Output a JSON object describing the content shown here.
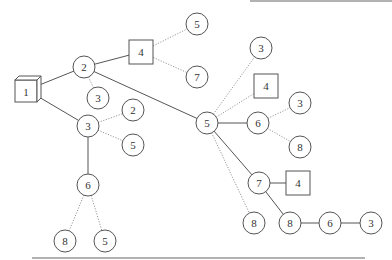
{
  "diagram": {
    "type": "tree",
    "top_rule": {
      "x1": 250,
      "x2": 392,
      "y": 1
    },
    "bottom_rule": {
      "x1": 32,
      "x2": 365,
      "y": 258
    },
    "nodes": [
      {
        "id": "n1",
        "label": "1",
        "shape": "cube",
        "x": 27,
        "y": 90
      },
      {
        "id": "n2",
        "label": "2",
        "shape": "circle",
        "x": 84,
        "y": 67
      },
      {
        "id": "n3a",
        "label": "3",
        "shape": "circle",
        "x": 98,
        "y": 98
      },
      {
        "id": "n3b",
        "label": "3",
        "shape": "circle",
        "x": 88,
        "y": 126
      },
      {
        "id": "n2b",
        "label": "2",
        "shape": "circle",
        "x": 133,
        "y": 110
      },
      {
        "id": "n5a",
        "label": "5",
        "shape": "circle",
        "x": 133,
        "y": 145
      },
      {
        "id": "n4a",
        "label": "4",
        "shape": "square",
        "x": 141,
        "y": 52
      },
      {
        "id": "n5b",
        "label": "5",
        "shape": "circle",
        "x": 197,
        "y": 24
      },
      {
        "id": "n7a",
        "label": "7",
        "shape": "circle",
        "x": 197,
        "y": 77
      },
      {
        "id": "n6a",
        "label": "6",
        "shape": "circle",
        "x": 88,
        "y": 185
      },
      {
        "id": "n8a",
        "label": "8",
        "shape": "circle",
        "x": 65,
        "y": 241
      },
      {
        "id": "n5c",
        "label": "5",
        "shape": "circle",
        "x": 105,
        "y": 241
      },
      {
        "id": "n5d",
        "label": "5",
        "shape": "circle",
        "x": 207,
        "y": 123
      },
      {
        "id": "n3c",
        "label": "3",
        "shape": "circle",
        "x": 261,
        "y": 48
      },
      {
        "id": "n4b",
        "label": "4",
        "shape": "square",
        "x": 266,
        "y": 86
      },
      {
        "id": "n6b",
        "label": "6",
        "shape": "circle",
        "x": 258,
        "y": 123
      },
      {
        "id": "n3d",
        "label": "3",
        "shape": "circle",
        "x": 300,
        "y": 103
      },
      {
        "id": "n8b",
        "label": "8",
        "shape": "circle",
        "x": 300,
        "y": 147
      },
      {
        "id": "n7b",
        "label": "7",
        "shape": "circle",
        "x": 259,
        "y": 183
      },
      {
        "id": "n4c",
        "label": "4",
        "shape": "square",
        "x": 298,
        "y": 183
      },
      {
        "id": "n8c",
        "label": "8",
        "shape": "circle",
        "x": 254,
        "y": 223
      },
      {
        "id": "n8d",
        "label": "8",
        "shape": "circle",
        "x": 290,
        "y": 223
      },
      {
        "id": "n6c",
        "label": "6",
        "shape": "circle",
        "x": 330,
        "y": 223
      },
      {
        "id": "n3e",
        "label": "3",
        "shape": "circle",
        "x": 371,
        "y": 223
      }
    ],
    "edges": [
      {
        "from": "n1",
        "to": "n2",
        "style": "solid"
      },
      {
        "from": "n1",
        "to": "n3b",
        "style": "solid"
      },
      {
        "from": "n2",
        "to": "n4a",
        "style": "solid"
      },
      {
        "from": "n2",
        "to": "n3a",
        "style": "dotted"
      },
      {
        "from": "n2",
        "to": "n5d",
        "style": "solid"
      },
      {
        "from": "n4a",
        "to": "n5b",
        "style": "dotted"
      },
      {
        "from": "n4a",
        "to": "n7a",
        "style": "dotted"
      },
      {
        "from": "n3b",
        "to": "n2b",
        "style": "dotted"
      },
      {
        "from": "n3b",
        "to": "n5a",
        "style": "dotted"
      },
      {
        "from": "n3b",
        "to": "n6a",
        "style": "solid"
      },
      {
        "from": "n6a",
        "to": "n8a",
        "style": "dotted"
      },
      {
        "from": "n6a",
        "to": "n5c",
        "style": "dotted"
      },
      {
        "from": "n5d",
        "to": "n3c",
        "style": "dotted"
      },
      {
        "from": "n5d",
        "to": "n4b",
        "style": "dotted"
      },
      {
        "from": "n5d",
        "to": "n6b",
        "style": "solid"
      },
      {
        "from": "n5d",
        "to": "n7b",
        "style": "solid"
      },
      {
        "from": "n5d",
        "to": "n8c",
        "style": "dotted"
      },
      {
        "from": "n6b",
        "to": "n3d",
        "style": "dotted"
      },
      {
        "from": "n6b",
        "to": "n8b",
        "style": "dotted"
      },
      {
        "from": "n7b",
        "to": "n4c",
        "style": "solid"
      },
      {
        "from": "n7b",
        "to": "n8d",
        "style": "solid"
      },
      {
        "from": "n8d",
        "to": "n6c",
        "style": "solid"
      },
      {
        "from": "n6c",
        "to": "n3e",
        "style": "solid"
      }
    ]
  }
}
